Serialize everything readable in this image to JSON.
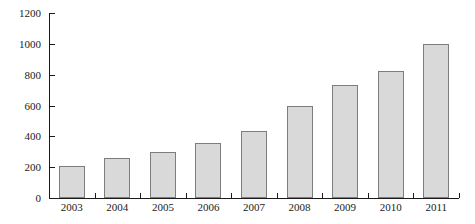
{
  "chart_data": {
    "type": "bar",
    "title": "",
    "xlabel": "",
    "ylabel": "",
    "categories": [
      "2003",
      "2004",
      "2005",
      "2006",
      "2007",
      "2008",
      "2009",
      "2010",
      "2011"
    ],
    "values": [
      210,
      260,
      300,
      355,
      435,
      600,
      730,
      825,
      1000
    ],
    "ylim": [
      0,
      1200
    ],
    "yticks": [
      0,
      200,
      400,
      600,
      800,
      1000,
      1200
    ],
    "ytick_labels": [
      "0",
      "200",
      "400",
      "600",
      "800",
      "1000",
      "1200"
    ],
    "grid": false,
    "legend": null,
    "bar_fill_color": "#d9d9d9",
    "bar_border_color": "#7d7d7d",
    "axis_color": "#1a1a1a",
    "background_color": "#ffffff"
  }
}
